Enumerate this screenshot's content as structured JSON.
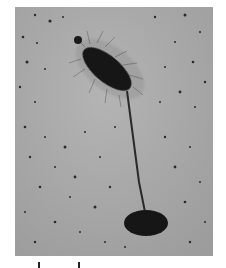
{
  "figure": {
    "type": "electron micrograph",
    "colors": {
      "background": "#ffffff",
      "field": "#a9a9a9",
      "cell": "#141414",
      "specks": "#2a2a2a"
    },
    "scale_bar": {
      "label": "",
      "tick_left_x": 38,
      "tick_right_x": 78
    }
  }
}
